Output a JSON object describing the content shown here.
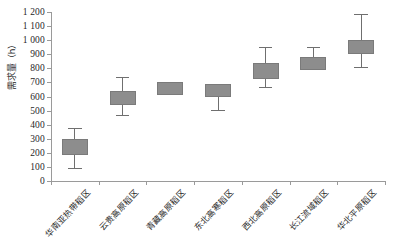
{
  "chart_data": {
    "type": "box",
    "title": "",
    "xlabel": "",
    "ylabel": "需求量（h）",
    "ylim": [
      0,
      1200
    ],
    "ytick_step": 100,
    "ytick_labels": [
      "0",
      "100",
      "200",
      "300",
      "400",
      "500",
      "600",
      "700",
      "800",
      "900",
      "1 000",
      "1 100",
      "1 200"
    ],
    "grid": false,
    "legend": null,
    "box_fill_color": "#8d8d8d",
    "box_line_color": "#7a7a7a",
    "axis_color": "#9a9a9a",
    "categories": [
      "华南亚热带稻区",
      "云贵高原稻区",
      "青藏高原稻区",
      "东北高寒稻区",
      "西北高原稻区",
      "长江流域稻区",
      "华北平原稻区"
    ],
    "boxes": [
      {
        "category": "华南亚热带稻区",
        "whisker_low": 90,
        "box_low": 185,
        "box_high": 300,
        "whisker_high": 375
      },
      {
        "category": "云贵高原稻区",
        "whisker_low": 470,
        "box_low": 540,
        "box_high": 640,
        "whisker_high": 735
      },
      {
        "category": "青藏高原稻区",
        "whisker_low": 610,
        "box_low": 610,
        "box_high": 700,
        "whisker_high": 700
      },
      {
        "category": "东北高寒稻区",
        "whisker_low": 505,
        "box_low": 595,
        "box_high": 690,
        "whisker_high": 690
      },
      {
        "category": "西北高原稻区",
        "whisker_low": 665,
        "box_low": 725,
        "box_high": 840,
        "whisker_high": 950
      },
      {
        "category": "长江流域稻区",
        "whisker_low": 785,
        "box_low": 785,
        "box_high": 880,
        "whisker_high": 950
      },
      {
        "category": "华北平原稻区",
        "whisker_low": 810,
        "box_low": 905,
        "box_high": 1000,
        "whisker_high": 1185
      }
    ]
  }
}
